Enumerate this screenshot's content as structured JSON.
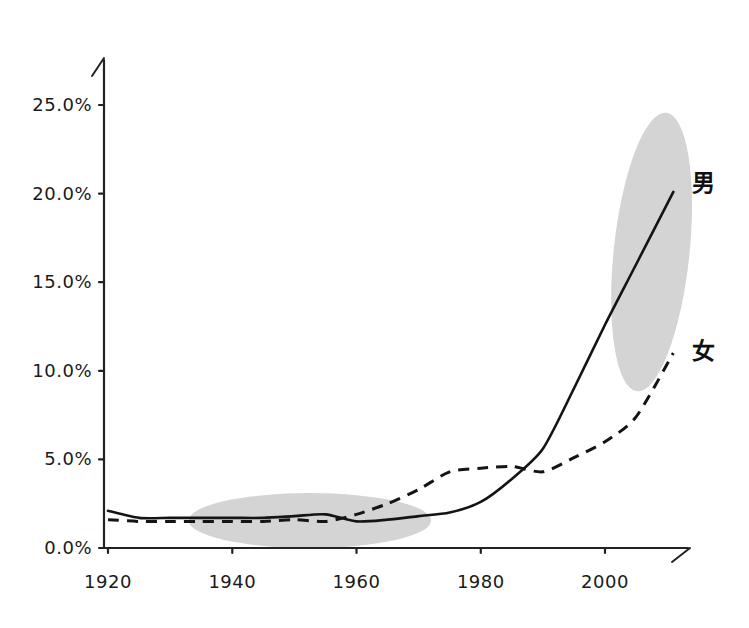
{
  "chart_data": {
    "type": "line",
    "title": "",
    "subtitle": "",
    "xlabel": "",
    "ylabel": "",
    "xlim": [
      1918,
      2013
    ],
    "ylim": [
      0,
      27
    ],
    "grid": false,
    "legend_position": "right-inline",
    "x_tick_labels": [
      "1920",
      "1940",
      "1960",
      "1980",
      "2000"
    ],
    "x_ticks": [
      1920,
      1940,
      1960,
      1980,
      2000
    ],
    "y_tick_labels": [
      "0.0%",
      "5.0%",
      "10.0%",
      "15.0%",
      "20.0%",
      "25.0%"
    ],
    "y_ticks": [
      0,
      5,
      10,
      15,
      20,
      25
    ],
    "series": [
      {
        "name": "男",
        "label": "男",
        "style": "solid",
        "label_x": 2014,
        "label_y": 20.6,
        "x": [
          1920,
          1925,
          1930,
          1935,
          1940,
          1945,
          1950,
          1955,
          1960,
          1965,
          1970,
          1975,
          1980,
          1985,
          1990,
          1995,
          2000,
          2005,
          2011
        ],
        "values": [
          2.1,
          1.7,
          1.7,
          1.7,
          1.7,
          1.7,
          1.8,
          1.9,
          1.5,
          1.6,
          1.8,
          2.0,
          2.6,
          3.9,
          5.6,
          9.0,
          12.6,
          16.0,
          20.1
        ]
      },
      {
        "name": "女",
        "label": "女",
        "style": "dashed",
        "label_x": 2014,
        "label_y": 11.1,
        "x": [
          1920,
          1925,
          1930,
          1935,
          1940,
          1945,
          1950,
          1955,
          1960,
          1965,
          1970,
          1975,
          1980,
          1985,
          1990,
          1995,
          2000,
          2005,
          2011
        ],
        "values": [
          1.6,
          1.5,
          1.5,
          1.5,
          1.5,
          1.5,
          1.6,
          1.5,
          1.9,
          2.5,
          3.3,
          4.3,
          4.5,
          4.6,
          4.3,
          5.1,
          6.0,
          7.4,
          11.0
        ]
      }
    ],
    "annotations": [
      {
        "name": "early-period-highlight",
        "shape": "ellipse",
        "cx": 1952.5,
        "cy": 1.55,
        "rx": 19.5,
        "ry": 1.55,
        "rotation": 0,
        "color": "#c8c8c8"
      },
      {
        "name": "recent-period-highlight",
        "shape": "ellipse",
        "cx": 2007.5,
        "cy": 16.7,
        "rx": 6.1,
        "ry": 7.9,
        "rotation": 6,
        "color": "#c8c8c8"
      }
    ],
    "colors": {
      "line": "#141414",
      "axis": "#222222",
      "highlight": "#c8c8c8",
      "background": "#ffffff"
    }
  },
  "axes": {
    "y_arrow": true,
    "x_arrow": true
  }
}
